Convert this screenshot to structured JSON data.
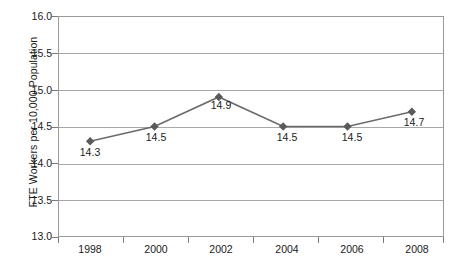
{
  "chart_data": {
    "type": "line",
    "title": "",
    "xlabel": "",
    "ylabel": "FTE Workers per 10,000 Population",
    "categories": [
      "1998",
      "2000",
      "2002",
      "2004",
      "2006",
      "2008"
    ],
    "values": [
      14.3,
      14.5,
      14.9,
      14.5,
      14.5,
      14.7
    ],
    "point_labels": [
      "14.3",
      "14.5",
      "14.9",
      "14.5",
      "14.5",
      "14.7"
    ],
    "ylim": [
      13.0,
      16.0
    ],
    "ytick_labels": [
      "16.0",
      "15.5",
      "15.0",
      "14.5",
      "14.0",
      "13.5",
      "13.0"
    ],
    "ytick_values": [
      16.0,
      15.5,
      15.0,
      14.5,
      14.0,
      13.5,
      13.0
    ],
    "grid": true,
    "legend": "none",
    "series": [
      {
        "name": "FTE Workers per 10,000 Population",
        "values": [
          14.3,
          14.5,
          14.9,
          14.5,
          14.5,
          14.7
        ],
        "line_color": "#6b6b6b",
        "marker": "diamond",
        "marker_color": "#5a5a5a"
      }
    ],
    "colors": {
      "line": "#6b6b6b",
      "marker": "#5a5a5a",
      "grid": "#a8a8a8",
      "frame": "#9a9a9a",
      "text": "#1a1a1a",
      "background": "#ffffff"
    }
  }
}
